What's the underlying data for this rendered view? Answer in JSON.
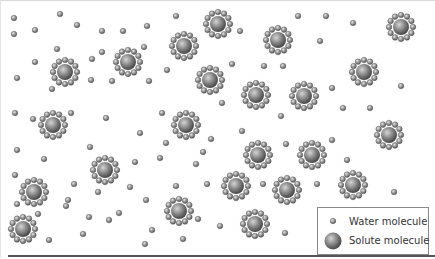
{
  "diagram": {
    "colors": {
      "water": "#8a8a8a",
      "solute": "#7a7a7a",
      "background": "#ffffff",
      "legend_border": "#888888"
    },
    "solute_molecules": [
      [
        65,
        72
      ],
      [
        128,
        62
      ],
      [
        184,
        46
      ],
      [
        218,
        24
      ],
      [
        278,
        40
      ],
      [
        210,
        80
      ],
      [
        256,
        95
      ],
      [
        304,
        96
      ],
      [
        364,
        72
      ],
      [
        401,
        27
      ],
      [
        53,
        125
      ],
      [
        186,
        125
      ],
      [
        105,
        170
      ],
      [
        258,
        155
      ],
      [
        312,
        155
      ],
      [
        389,
        135
      ],
      [
        236,
        186
      ],
      [
        287,
        190
      ],
      [
        353,
        185
      ],
      [
        34,
        192
      ],
      [
        179,
        211
      ],
      [
        255,
        224
      ],
      [
        23,
        229
      ]
    ],
    "water_molecules": [
      [
        14,
        18
      ],
      [
        60,
        14
      ],
      [
        14,
        34
      ],
      [
        35,
        30
      ],
      [
        77,
        25
      ],
      [
        102,
        31
      ],
      [
        123,
        31
      ],
      [
        147,
        26
      ],
      [
        176,
        16
      ],
      [
        240,
        31
      ],
      [
        298,
        16
      ],
      [
        326,
        16
      ],
      [
        353,
        23
      ],
      [
        320,
        41
      ],
      [
        57,
        49
      ],
      [
        35,
        62
      ],
      [
        102,
        52
      ],
      [
        144,
        47
      ],
      [
        92,
        59
      ],
      [
        264,
        66
      ],
      [
        167,
        70
      ],
      [
        283,
        66
      ],
      [
        17,
        78
      ],
      [
        91,
        80
      ],
      [
        112,
        81
      ],
      [
        149,
        81
      ],
      [
        232,
        64
      ],
      [
        332,
        88
      ],
      [
        401,
        86
      ],
      [
        52,
        89
      ],
      [
        222,
        103
      ],
      [
        343,
        108
      ],
      [
        15,
        113
      ],
      [
        33,
        119
      ],
      [
        71,
        113
      ],
      [
        106,
        118
      ],
      [
        162,
        113
      ],
      [
        281,
        116
      ],
      [
        370,
        108
      ],
      [
        140,
        133
      ],
      [
        242,
        131
      ],
      [
        90,
        147
      ],
      [
        211,
        139
      ],
      [
        332,
        140
      ],
      [
        17,
        150
      ],
      [
        44,
        159
      ],
      [
        160,
        158
      ],
      [
        286,
        144
      ],
      [
        166,
        143
      ],
      [
        135,
        162
      ],
      [
        203,
        152
      ],
      [
        347,
        160
      ],
      [
        15,
        175
      ],
      [
        74,
        184
      ],
      [
        68,
        200
      ],
      [
        98,
        192
      ],
      [
        130,
        187
      ],
      [
        176,
        186
      ],
      [
        196,
        164
      ],
      [
        207,
        184
      ],
      [
        263,
        184
      ],
      [
        317,
        184
      ],
      [
        394,
        192
      ],
      [
        17,
        204
      ],
      [
        38,
        214
      ],
      [
        66,
        206
      ],
      [
        89,
        217
      ],
      [
        119,
        213
      ],
      [
        146,
        200
      ],
      [
        152,
        230
      ],
      [
        198,
        219
      ],
      [
        220,
        226
      ],
      [
        285,
        233
      ],
      [
        384,
        222
      ],
      [
        49,
        240
      ],
      [
        83,
        234
      ],
      [
        109,
        220
      ],
      [
        145,
        244
      ],
      [
        183,
        239
      ]
    ],
    "solute_radius": 8,
    "shell_radius": 12,
    "shell_count": 12,
    "water_radius": 2.8
  },
  "legend": {
    "items": [
      {
        "icon": "water-molecule",
        "label": "Water molecule"
      },
      {
        "icon": "solute-molecule",
        "label": "Solute molecule"
      }
    ]
  }
}
